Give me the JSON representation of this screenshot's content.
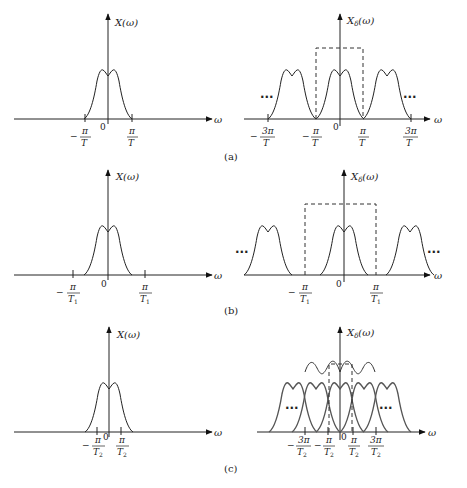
{
  "figure": {
    "colors": {
      "stroke": "#222222",
      "background": "#ffffff"
    },
    "panels": [
      {
        "caption": "(a)",
        "left": {
          "ylabel": "X(ω)",
          "xlabel": "ω",
          "origin": "0",
          "ticks": [
            {
              "sign": "−",
              "num": "π",
              "den": "T"
            },
            {
              "sign": "",
              "num": "π",
              "den": "T"
            }
          ]
        },
        "right": {
          "ylabel": "X",
          "ylabel_sub": "δ",
          "ylabel_arg": "(ω)",
          "xlabel": "ω",
          "origin": "0",
          "ellipsis": "···",
          "ticks": [
            {
              "sign": "−",
              "num": "3π",
              "den": "T"
            },
            {
              "sign": "−",
              "num": "π",
              "den": "T"
            },
            {
              "sign": "",
              "num": "π",
              "den": "T"
            },
            {
              "sign": "",
              "num": "3π",
              "den": "T"
            }
          ]
        }
      },
      {
        "caption": "(b)",
        "left": {
          "ylabel": "X(ω)",
          "xlabel": "ω",
          "origin": "0",
          "ticks": [
            {
              "sign": "−",
              "num": "π",
              "den": "T",
              "sub": "1"
            },
            {
              "sign": "",
              "num": "π",
              "den": "T",
              "sub": "1"
            }
          ]
        },
        "right": {
          "ylabel": "X",
          "ylabel_sub": "δ",
          "ylabel_arg": "(ω)",
          "xlabel": "ω",
          "origin": "0",
          "ellipsis": "···",
          "ticks": [
            {
              "sign": "−",
              "num": "π",
              "den": "T",
              "sub": "1"
            },
            {
              "sign": "",
              "num": "π",
              "den": "T",
              "sub": "1"
            }
          ]
        }
      },
      {
        "caption": "(c)",
        "left": {
          "ylabel": "X(ω)",
          "xlabel": "ω",
          "origin": "0",
          "ticks": [
            {
              "sign": "−",
              "num": "π",
              "den": "T",
              "sub": "2"
            },
            {
              "sign": "",
              "num": "π",
              "den": "T",
              "sub": "2"
            }
          ]
        },
        "right": {
          "ylabel": "X",
          "ylabel_sub": "δ",
          "ylabel_arg": "(ω)",
          "xlabel": "ω",
          "origin": "0",
          "ellipsis": "···",
          "ticks": [
            {
              "sign": "−",
              "num": "3π",
              "den": "T",
              "sub": "2"
            },
            {
              "sign": "−",
              "num": "π",
              "den": "T",
              "sub": "2"
            },
            {
              "sign": "",
              "num": "π",
              "den": "T",
              "sub": "2"
            },
            {
              "sign": "",
              "num": "3π",
              "den": "T",
              "sub": "2"
            }
          ]
        }
      }
    ]
  }
}
